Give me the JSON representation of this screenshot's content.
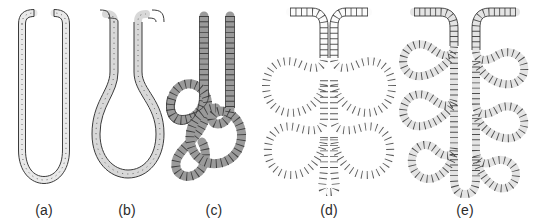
{
  "figure": {
    "width": 534,
    "height": 224,
    "background": "#ffffff",
    "caption_style": "lowercase-letter-in-parentheses"
  },
  "colors": {
    "outline": "#3b3b3b",
    "rung": "#4a4a4a",
    "fill_light": "#f2f2f2",
    "fill_medium": "#d8d8d8",
    "fill_dark": "#9a9a9a",
    "label_text": "#2b2b2b",
    "background": "#ffffff"
  },
  "panels": [
    {
      "id": "a",
      "label": "(a)",
      "shape_name": "simple-u-tube",
      "description": "Unbranched straight tubule folded into a narrow U with two parallel limbs and flared openings at the top",
      "fill": "#e9e9e9",
      "wall_width": 7,
      "x": 0,
      "width": 88,
      "label_x": 37
    },
    {
      "id": "b",
      "label": "(b)",
      "shape_name": "pear-shaped-loop",
      "description": "Tubule with two straight limbs opening into a single large rounded pear-shaped dilation at the base",
      "fill": "#d8d8d8",
      "wall_width": 8,
      "x": 88,
      "width": 78,
      "label_x": 105
    },
    {
      "id": "c",
      "label": "(c)",
      "shape_name": "coiled-spiral-tubule",
      "description": "Tubule whose limbs wind into interlocking spiral coils, one tight inner whorl and one broad outer whorl",
      "fill": "#9a9a9a",
      "wall_width": 9,
      "x": 166,
      "width": 96,
      "label_x": 198
    },
    {
      "id": "d",
      "label": "(d)",
      "shape_name": "branched-lobular-tubule",
      "description": "Tubule branching into multiple rounded teardrop-shaped lobes radiating symmetrically from a central axis",
      "fill": "#fbfbfb",
      "wall_width": 8,
      "x": 262,
      "width": 134,
      "label_x": 313
    },
    {
      "id": "e",
      "label": "(e)",
      "shape_name": "pinnate-branched-tubule",
      "description": "Tubule with elongated narrow side-branches arranged in a feather-like pinnate pattern along a central stem",
      "fill": "#e4e4e4",
      "wall_width": 8,
      "x": 396,
      "width": 138,
      "label_x": 468
    }
  ]
}
